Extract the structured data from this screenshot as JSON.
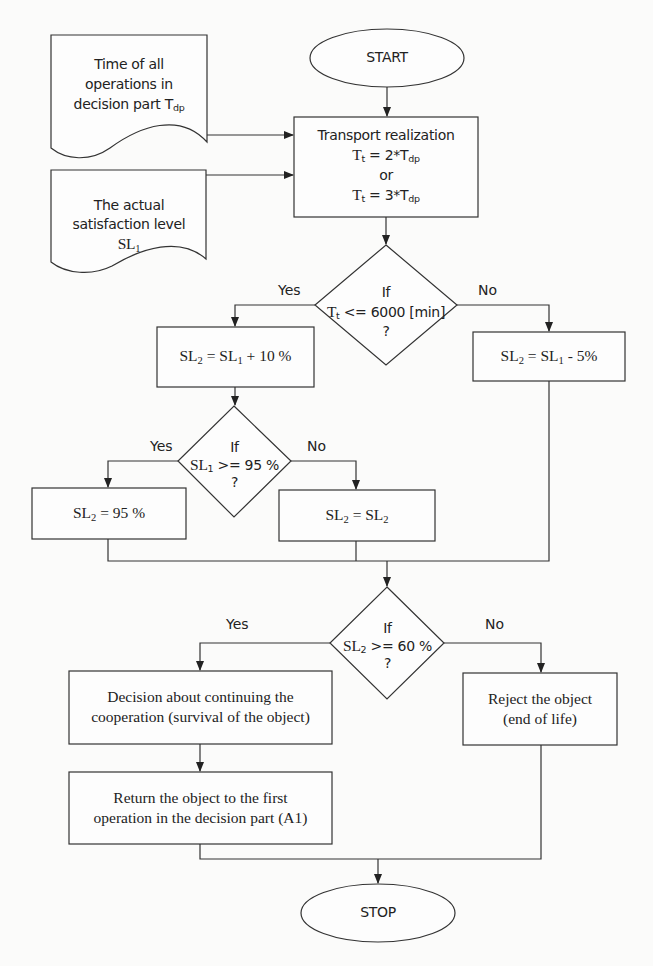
{
  "flowchart": {
    "start": "START",
    "stop": "STOP",
    "inputs": [
      {
        "lines": [
          "Time of all",
          "operations in"
        ],
        "last_text": "decision part T",
        "last_sub": "dp"
      },
      {
        "lines": [
          "The actual",
          "satisfaction level"
        ],
        "last_text": "SL",
        "last_sub": "1"
      }
    ],
    "transport": {
      "title": "Transport realization",
      "formula1": {
        "lhs": "T",
        "lhs_sub": "t",
        "mid": " = 2*T",
        "rhs_sub": "dp"
      },
      "or": "or",
      "formula2": {
        "lhs": "T",
        "lhs_sub": "t",
        "mid": " = 3*T",
        "rhs_sub": "dp"
      }
    },
    "decision1": {
      "if": "If",
      "var": "T",
      "var_sub": "t",
      "cond": " <= 6000 [min]",
      "q": "?",
      "yes": "Yes",
      "no": "No"
    },
    "box_inc": {
      "a": "SL",
      "a_sub": "2",
      "mid": " =  SL",
      "b_sub": "1",
      "tail": " + 10 %"
    },
    "box_dec": {
      "a": "SL",
      "a_sub": "2",
      "mid": " = SL",
      "b_sub": "1",
      "tail": " - 5%"
    },
    "decision2": {
      "if": "If",
      "var": "SL",
      "var_sub": "1",
      "cond": " >= 95 %",
      "q": "?",
      "yes": "Yes",
      "no": "No"
    },
    "box_cap": {
      "a": "SL",
      "a_sub": "2",
      "tail": " = 95 %"
    },
    "box_same": {
      "a": "SL",
      "a_sub": "2",
      "mid": " =  SL",
      "b_sub": "2"
    },
    "decision3": {
      "if": "If",
      "var": "SL",
      "var_sub": "2",
      "cond": " >= 60 %",
      "q": "?",
      "yes": "Yes",
      "no": "No"
    },
    "continue_box": {
      "lines": [
        "Decision about continuing the",
        "cooperation (survival of the object)"
      ]
    },
    "return_box": {
      "lines": [
        "Return the object  to the first",
        "operation in the decision part (A1)"
      ]
    },
    "reject_box": {
      "lines": [
        "Reject the object",
        "(end of life)"
      ]
    }
  }
}
